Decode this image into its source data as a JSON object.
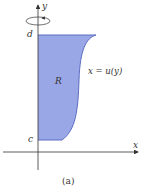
{
  "figure": {
    "caption": "(a)",
    "axes": {
      "x_label": "x",
      "y_label": "y"
    },
    "ticks": {
      "top": "d",
      "bottom": "c"
    },
    "region_label": "R",
    "curve_label": "x = u(y)",
    "rotation_indicator": "rotation about y-axis"
  },
  "colors": {
    "region_fill": "#9aa7e6",
    "region_edge": "#5b6cc2",
    "axis": "#333333"
  }
}
